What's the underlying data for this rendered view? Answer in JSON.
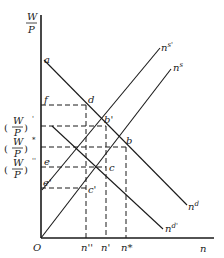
{
  "axes": {
    "y_label_num": "W",
    "y_label_den": "P",
    "x_label": "n",
    "origin": "O"
  },
  "y_ticks": [
    {
      "label": "(W/P)'",
      "num": "W",
      "den": "P",
      "sup": "'"
    },
    {
      "label": "(W/P)*",
      "num": "W",
      "den": "P",
      "sup": "*"
    },
    {
      "label": "(W/P)''",
      "num": "W",
      "den": "P",
      "sup": "''"
    }
  ],
  "x_ticks": [
    "n''",
    "n'",
    "n*"
  ],
  "points": {
    "a": "a",
    "f": "f",
    "d": "d",
    "b_prime": "b'",
    "b": "b",
    "e": "e",
    "c": "c",
    "e_prime": "e'",
    "c_prime": "c'"
  },
  "curves": {
    "supply": "n",
    "supply_sup": "s",
    "supply_shift": "n",
    "supply_shift_sup": "s'",
    "demand": "n",
    "demand_sup": "d",
    "demand_shift": "n",
    "demand_shift_sup": "d'"
  }
}
